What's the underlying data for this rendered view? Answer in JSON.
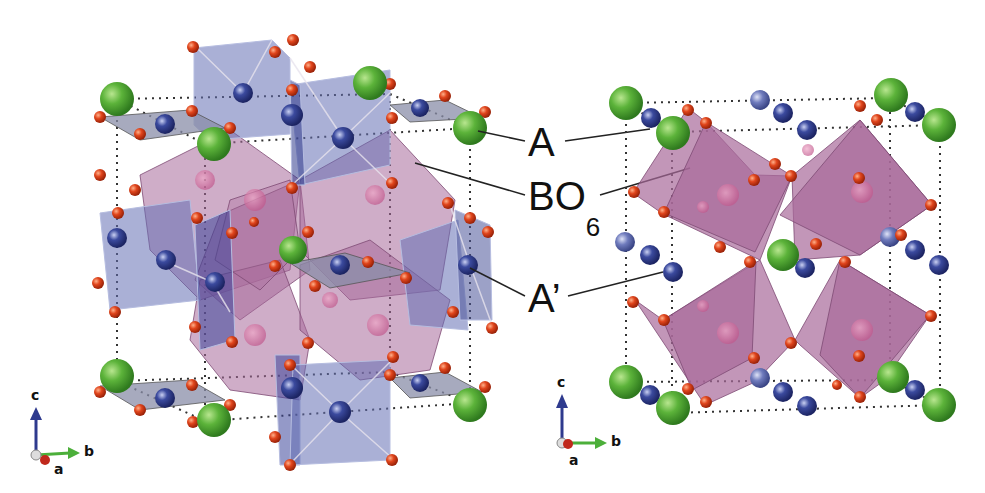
{
  "figure": {
    "type": "crystal-structure-diagram",
    "panels": [
      {
        "id": "left",
        "description": "Perspective view of A A'3 B4 O12 quadruple perovskite unit cell"
      },
      {
        "id": "right",
        "description": "View along a-axis of same structure"
      }
    ]
  },
  "labels": {
    "a_site": "A",
    "bo6_main": "BO",
    "bo6_sub": "6",
    "a_prime": "A’"
  },
  "axes_left": {
    "c": "c",
    "b": "b",
    "a": "a"
  },
  "axes_right": {
    "c": "c",
    "b": "b",
    "a": "a"
  },
  "colors": {
    "a_site": "#5cb33a",
    "a_prime_site": "#2f3a8c",
    "a_prime_light": "#5a66a8",
    "oxygen": "#e0451c",
    "bo6_octahedra": "#a86a9a",
    "a_prime_square": "#6470b4",
    "cell_edge": "#333333",
    "axis_c": "#2e3a8e",
    "axis_b": "#4caf3a",
    "axis_a": "#c0281c"
  }
}
